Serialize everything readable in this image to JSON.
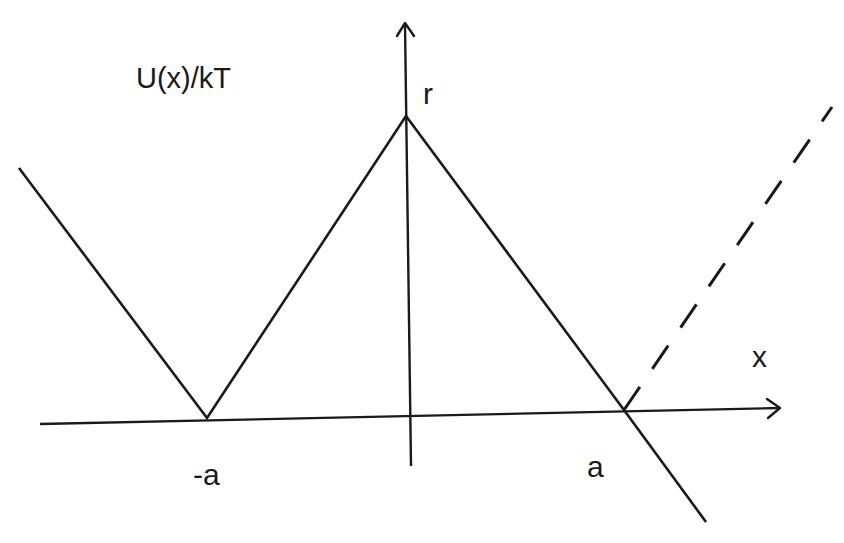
{
  "diagram": {
    "y_axis_label": "U(x)/kT",
    "x_axis_label": "x",
    "peak_label": "r",
    "left_min_label": "-a",
    "right_min_label": "a",
    "colors": {
      "line": "#1a1a1a",
      "background": "#ffffff"
    },
    "curves": [
      {
        "name": "solid-potential",
        "style": "solid",
        "description": "V-shaped potential with peak r at x=0, zeros at -a and a, continuing below axis past a"
      },
      {
        "name": "dashed-reflection",
        "style": "dashed",
        "description": "dashed continuation rising from x=a"
      }
    ]
  }
}
